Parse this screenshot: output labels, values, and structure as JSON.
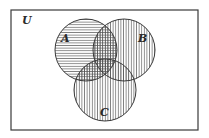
{
  "diagram": {
    "type": "venn",
    "universe": {
      "label": "U",
      "x": 11,
      "y": 10,
      "width": 187,
      "height": 120,
      "label_pos": {
        "x": 22,
        "y": 24
      }
    },
    "sets": [
      {
        "name": "A",
        "label": "A",
        "cx": 86,
        "cy": 50,
        "r": 31,
        "hatch": "horizontal",
        "label_pos": {
          "x": 61,
          "y": 42
        }
      },
      {
        "name": "B",
        "label": "B",
        "cx": 124,
        "cy": 50,
        "r": 31,
        "hatch": "vertical",
        "label_pos": {
          "x": 138,
          "y": 42
        }
      },
      {
        "name": "C",
        "label": "C",
        "cx": 105,
        "cy": 90,
        "r": 31,
        "hatch": "vertical",
        "label_pos": {
          "x": 100,
          "y": 116
        }
      }
    ],
    "colors": {
      "line": "#3a3a3a",
      "hatch": "#555555",
      "background": "#ffffff"
    }
  }
}
